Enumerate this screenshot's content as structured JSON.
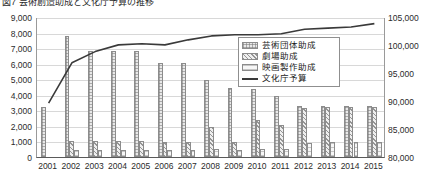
{
  "figure": {
    "title": "図7 芸術創造助成と文化庁予算の推移"
  },
  "legend": {
    "position": "inside-top-right",
    "items": [
      {
        "label": "芸術団体助成",
        "style": "bar",
        "key": "s0"
      },
      {
        "label": "劇場助成",
        "style": "bar",
        "key": "s1"
      },
      {
        "label": "映画製作助成",
        "style": "bar",
        "key": "s2"
      },
      {
        "label": "文化庁予算",
        "style": "line",
        "key": "line"
      }
    ]
  },
  "axes": {
    "left": {
      "ticks": [
        "9,000",
        "8,000",
        "7,000",
        "6,000",
        "5,000",
        "4,000",
        "3,000",
        "2,000",
        "1,000",
        "0"
      ],
      "min": 0,
      "max": 9000,
      "step": 1000
    },
    "right": {
      "ticks": [
        "105,000",
        "100,000",
        "95,000",
        "90,000",
        "85,000",
        "80,000"
      ],
      "min": 80000,
      "max": 105000,
      "step": 5000
    },
    "x": {
      "ticks": [
        "2001",
        "2002",
        "2003",
        "2004",
        "2005",
        "2006",
        "2007",
        "2008",
        "2009",
        "2010",
        "2011",
        "2012",
        "2013",
        "2014",
        "2015"
      ]
    }
  },
  "chart_data": {
    "type": "bar",
    "title": "図7 芸術創造助成と文化庁予算の推移",
    "xlabel": "",
    "ylabel": "",
    "grid": true,
    "legend_position": "inside-top-right",
    "categories": [
      "2001",
      "2002",
      "2003",
      "2004",
      "2005",
      "2006",
      "2007",
      "2008",
      "2009",
      "2010",
      "2011",
      "2012",
      "2013",
      "2014",
      "2015"
    ],
    "ylim": [
      0,
      9000
    ],
    "y2lim": [
      80000,
      105000
    ],
    "series": [
      {
        "name": "芸術団体助成",
        "axis": "left",
        "type": "bar",
        "values": [
          3200,
          7750,
          6800,
          6800,
          6800,
          6050,
          6050,
          4950,
          4450,
          4350,
          3900,
          3250,
          3300,
          3300,
          3300
        ]
      },
      {
        "name": "劇場助成",
        "axis": "left",
        "type": "bar",
        "values": [
          0,
          1050,
          1050,
          1000,
          1000,
          950,
          950,
          1950,
          950,
          2400,
          2050,
          3150,
          3200,
          3200,
          3200
        ]
      },
      {
        "name": "映画製作助成",
        "axis": "left",
        "type": "bar",
        "values": [
          0,
          450,
          450,
          450,
          450,
          450,
          450,
          500,
          450,
          500,
          500,
          900,
          950,
          950,
          950
        ]
      },
      {
        "name": "文化庁予算",
        "axis": "right",
        "type": "line",
        "values": [
          89800,
          97000,
          99000,
          100200,
          100400,
          100200,
          101100,
          101800,
          102000,
          102000,
          102200,
          103000,
          103200,
          103400,
          104000
        ]
      }
    ]
  }
}
